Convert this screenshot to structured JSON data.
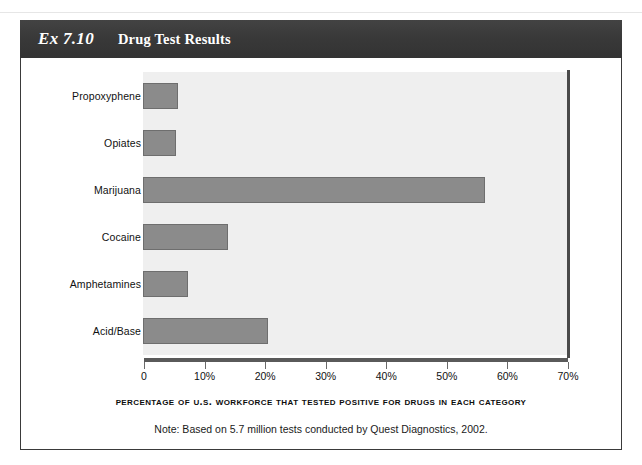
{
  "header": {
    "exhibit_number": "Ex 7.10",
    "title": "Drug Test Results",
    "bar_color": "#3b3b3b",
    "text_color": "#ffffff"
  },
  "chart_data": {
    "type": "bar",
    "orientation": "horizontal",
    "title": "Drug Test Results",
    "categories": [
      "Propoxyphene",
      "Opiates",
      "Marijuana",
      "Cocaine",
      "Amphetamines",
      "Acid/Base"
    ],
    "values": [
      5.8,
      5.4,
      56.5,
      14.1,
      7.5,
      20.6
    ],
    "xlabel": "Percentage of U.S. Workforce that Tested Positive for Drugs in Each Category",
    "ylabel": "",
    "xlim": [
      0,
      70
    ],
    "xticks": [
      0,
      10,
      20,
      30,
      40,
      50,
      60,
      70
    ],
    "xticklabels": [
      "0",
      "10%",
      "20%",
      "30%",
      "40%",
      "50%",
      "60%",
      "70%"
    ],
    "grid": false,
    "legend": false,
    "note": "Note: Based on 5.7 million tests conducted by Quest Diagnostics, 2002.",
    "bar_fill_color": "#8b8b8b",
    "bar_border_color": "#6e6e6e",
    "plot_background_color": "#efefef"
  }
}
